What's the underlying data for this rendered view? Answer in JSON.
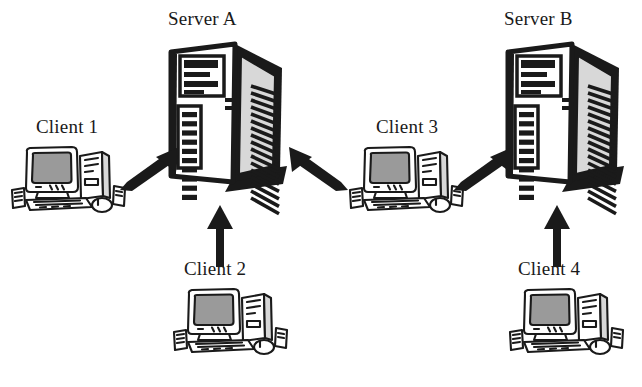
{
  "diagram": {
    "type": "network-diagram",
    "background_color": "#ffffff",
    "ink_color": "#1a1a1a",
    "screen_fill": "#9a9a9a",
    "case_fill": "#d8d8d8",
    "nodes": [
      {
        "id": "server-a",
        "label": "Server A",
        "kind": "server-tower",
        "label_x": 168,
        "label_y": 8,
        "icon_x": 163,
        "icon_y": 34,
        "icon_w": 124,
        "icon_h": 170
      },
      {
        "id": "server-b",
        "label": "Server B",
        "kind": "server-tower",
        "label_x": 504,
        "label_y": 8,
        "icon_x": 500,
        "icon_y": 34,
        "icon_w": 124,
        "icon_h": 170
      },
      {
        "id": "client-1",
        "label": "Client 1",
        "kind": "desktop-workstation",
        "label_x": 36,
        "label_y": 116,
        "icon_x": 10,
        "icon_y": 140,
        "icon_w": 118,
        "icon_h": 80
      },
      {
        "id": "client-2",
        "label": "Client 2",
        "kind": "desktop-workstation",
        "label_x": 184,
        "label_y": 258,
        "icon_x": 172,
        "icon_y": 282,
        "icon_w": 118,
        "icon_h": 80
      },
      {
        "id": "client-3",
        "label": "Client 3",
        "kind": "desktop-workstation",
        "label_x": 376,
        "label_y": 116,
        "icon_x": 348,
        "icon_y": 140,
        "icon_w": 118,
        "icon_h": 80
      },
      {
        "id": "client-4",
        "label": "Client 4",
        "kind": "desktop-workstation",
        "label_x": 518,
        "label_y": 258,
        "icon_x": 508,
        "icon_y": 282,
        "icon_w": 118,
        "icon_h": 80
      }
    ],
    "connections": [
      {
        "id": "client1-to-serverA",
        "from": "client-1",
        "to": "server-a",
        "direction": "up-right",
        "x": 118,
        "y": 146,
        "w": 62,
        "h": 46
      },
      {
        "id": "client3-to-serverA",
        "from": "client-3",
        "to": "server-a",
        "direction": "up-left",
        "x": 288,
        "y": 146,
        "w": 62,
        "h": 46
      },
      {
        "id": "client2-to-serverA",
        "from": "client-2",
        "to": "server-a",
        "direction": "up",
        "x": 205,
        "y": 205,
        "w": 30,
        "h": 62
      },
      {
        "id": "client3-to-serverB",
        "from": "client-3",
        "to": "server-b",
        "direction": "up-right",
        "x": 452,
        "y": 146,
        "w": 62,
        "h": 46
      },
      {
        "id": "client4-to-serverB",
        "from": "client-4",
        "to": "server-b",
        "direction": "up",
        "x": 542,
        "y": 205,
        "w": 30,
        "h": 62
      }
    ]
  }
}
